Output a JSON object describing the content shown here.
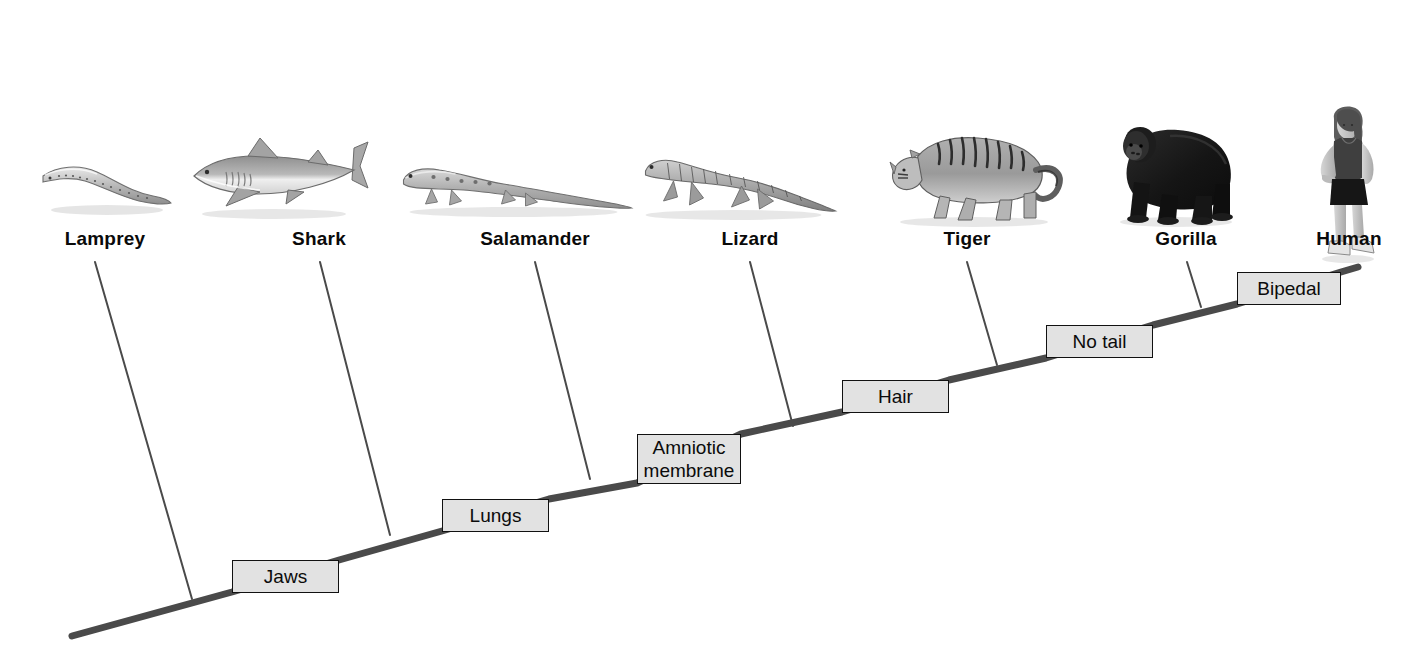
{
  "diagram": {
    "type": "cladogram",
    "background_color": "#ffffff",
    "trunk_color": "#4a4a4a",
    "branch_color": "#4a4a4a",
    "trait_box_fill": "#e2e2e2",
    "trait_box_border": "#111111",
    "label_color": "#0a0a0a"
  },
  "taxa": [
    {
      "id": "lamprey",
      "label": "Lamprey",
      "label_x": 105,
      "label_y": 228,
      "image": "lamprey-illustration",
      "img_x": 105,
      "img_y": 148,
      "tip_x": 95,
      "tip_y": 262,
      "base_x": 192,
      "base_y": 599
    },
    {
      "id": "shark",
      "label": "Shark",
      "label_x": 319,
      "label_y": 228,
      "image": "shark-illustration",
      "img_x": 277,
      "img_y": 132,
      "tip_x": 320,
      "tip_y": 262,
      "base_x": 390,
      "base_y": 535
    },
    {
      "id": "salamander",
      "label": "Salamander",
      "label_x": 535,
      "label_y": 228,
      "image": "salamander-illustration",
      "img_x": 516,
      "img_y": 150,
      "tip_x": 535,
      "tip_y": 262,
      "base_x": 590,
      "base_y": 478
    },
    {
      "id": "lizard",
      "label": "Lizard",
      "label_x": 750,
      "label_y": 228,
      "image": "lizard-illustration",
      "img_x": 740,
      "img_y": 145,
      "tip_x": 750,
      "tip_y": 262,
      "base_x": 793,
      "base_y": 425
    },
    {
      "id": "tiger",
      "label": "Tiger",
      "label_x": 967,
      "label_y": 228,
      "image": "tiger-illustration",
      "img_x": 975,
      "img_y": 118,
      "tip_x": 967,
      "tip_y": 262,
      "base_x": 997,
      "base_y": 364
    },
    {
      "id": "gorilla",
      "label": "Gorilla",
      "label_x": 1186,
      "label_y": 228,
      "image": "gorilla-illustration",
      "img_x": 1175,
      "img_y": 112,
      "tip_x": 1187,
      "tip_y": 262,
      "base_x": 1201,
      "base_y": 306
    },
    {
      "id": "human",
      "label": "Human",
      "label_x": 1349,
      "label_y": 228,
      "image": "human-illustration",
      "img_x": 1347,
      "img_y": 105,
      "tip_x": 1349,
      "tip_y": 262,
      "base_x": 1349,
      "base_y": 270
    }
  ],
  "traits": [
    {
      "id": "jaws",
      "label": "Jaws",
      "lines": [
        "Jaws"
      ],
      "x": 232,
      "y": 560,
      "width": 107,
      "height": 33
    },
    {
      "id": "lungs",
      "label": "Lungs",
      "lines": [
        "Lungs"
      ],
      "x": 442,
      "y": 499,
      "width": 107,
      "height": 33
    },
    {
      "id": "amniotic-membrane",
      "label": "Amniotic membrane",
      "lines": [
        "Amniotic",
        "membrane"
      ],
      "x": 637,
      "y": 434,
      "width": 104,
      "height": 50
    },
    {
      "id": "hair",
      "label": "Hair",
      "lines": [
        "Hair"
      ],
      "x": 842,
      "y": 380,
      "width": 107,
      "height": 33
    },
    {
      "id": "no-tail",
      "label": "No tail",
      "lines": [
        "No tail"
      ],
      "x": 1046,
      "y": 325,
      "width": 107,
      "height": 33
    },
    {
      "id": "bipedal",
      "label": "Bipedal",
      "lines": [
        "Bipedal"
      ],
      "x": 1237,
      "y": 272,
      "width": 104,
      "height": 33
    }
  ],
  "trunk": {
    "points": [
      {
        "x": 72,
        "y": 636
      },
      {
        "x": 232,
        "y": 592
      },
      {
        "x": 339,
        "y": 560
      },
      {
        "x": 442,
        "y": 531
      },
      {
        "x": 549,
        "y": 499
      },
      {
        "x": 637,
        "y": 483
      },
      {
        "x": 741,
        "y": 434
      },
      {
        "x": 842,
        "y": 412
      },
      {
        "x": 949,
        "y": 380
      },
      {
        "x": 1046,
        "y": 358
      },
      {
        "x": 1153,
        "y": 325
      },
      {
        "x": 1237,
        "y": 304
      },
      {
        "x": 1341,
        "y": 272
      },
      {
        "x": 1358,
        "y": 267
      }
    ]
  }
}
